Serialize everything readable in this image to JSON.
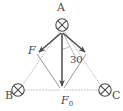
{
  "figure": {
    "background_color": "#ffffff",
    "stroke_color": "#4a4a4a",
    "dotted_color": "#b9b9b9",
    "thin_color": "#a8a8a8",
    "labels": {
      "vertex_a": "A",
      "vertex_b": "B",
      "vertex_c": "C",
      "force_f": "F",
      "force_f0_base": "F",
      "force_f0_sub": "0",
      "angle": "30"
    },
    "nodes": [
      {
        "name": "A",
        "label": "A",
        "x": 62,
        "y": 25,
        "icon": "crossed-circle-icon"
      },
      {
        "name": "B",
        "label": "B",
        "x": 18,
        "y": 90,
        "icon": "crossed-circle-icon"
      },
      {
        "name": "C",
        "label": "C",
        "x": 105,
        "y": 90,
        "icon": "crossed-circle-icon"
      },
      {
        "name": "F0",
        "label": "F0",
        "x": 62,
        "y": 90,
        "icon": "vector-tip"
      }
    ],
    "vectors": [
      {
        "name": "force-f-left",
        "label": "F",
        "from_x": 62,
        "from_y": 32,
        "to_x": 38,
        "to_y": 53
      },
      {
        "name": "force-f0-down",
        "label": "F0",
        "from_x": 62,
        "from_y": 32,
        "to_x": 62,
        "to_y": 88
      },
      {
        "name": "force-f-right",
        "label": "",
        "from_x": 62,
        "from_y": 32,
        "to_x": 86,
        "to_y": 53
      }
    ],
    "angle_marker": {
      "name": "angle-30-degrees",
      "value": "30",
      "unit": "degrees",
      "between": [
        "force-f0-down",
        "force-f-right"
      ],
      "vertex_x": 62,
      "vertex_y": 32
    },
    "dotted_edges": [
      {
        "name": "edge-a-b",
        "from": "A",
        "to": "B"
      },
      {
        "name": "edge-a-c",
        "from": "A",
        "to": "C"
      },
      {
        "name": "edge-b-f0",
        "from": "B",
        "to": "F0"
      },
      {
        "name": "edge-f0-c",
        "from": "F0",
        "to": "C"
      }
    ],
    "solid_edges": [
      {
        "name": "edge-ftip-f0",
        "from": "force-f-left-tip",
        "to": "F0"
      },
      {
        "name": "edge-rtip-f0",
        "from": "force-f-right-tip",
        "to": "F0"
      }
    ]
  }
}
